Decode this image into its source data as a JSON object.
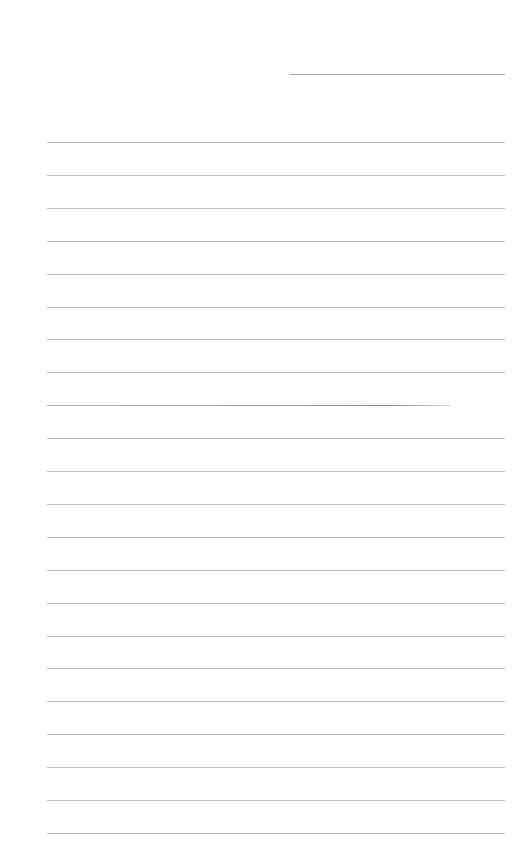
{
  "page": {
    "type": "lined-writing-sheet",
    "header_line": {
      "label": ""
    },
    "rules": {
      "count": 22,
      "start_y": 142,
      "spacing": 32.9,
      "dark_index": 8
    },
    "colors": {
      "background": "#ffffff",
      "rule": "#bdbdbd",
      "header_rule": "#a9a9a9"
    }
  }
}
